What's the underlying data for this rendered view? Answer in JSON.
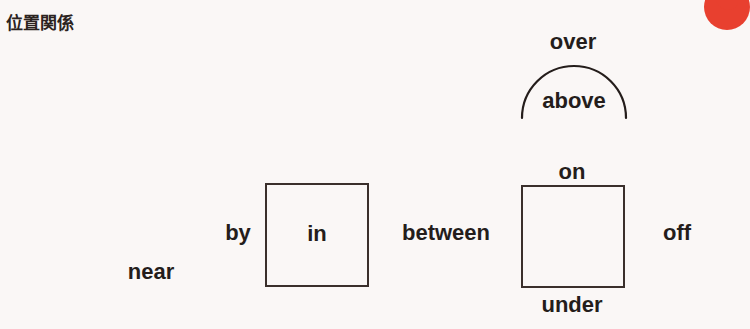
{
  "header": {
    "title": "位置関係"
  },
  "decoration": {
    "blob_name": "red-circle-decoration",
    "blob_color": "#e8402f"
  },
  "diagram": {
    "type": "prepositions-of-place",
    "background_color": "#faf7f6",
    "ink_color": "#241d1b",
    "arc": {
      "name": "over-above-arc",
      "description": "semicircular arc spanning the words over (outside/above the arc) and above (inside the arc)"
    },
    "boxes": [
      {
        "name": "left-box",
        "inner_label": "in"
      },
      {
        "name": "right-box",
        "inner_label": ""
      }
    ],
    "labels": {
      "over": "over",
      "above": "above",
      "by": "by",
      "in": "in",
      "near": "near",
      "between": "between",
      "on": "on",
      "under": "under",
      "off": "off"
    }
  }
}
